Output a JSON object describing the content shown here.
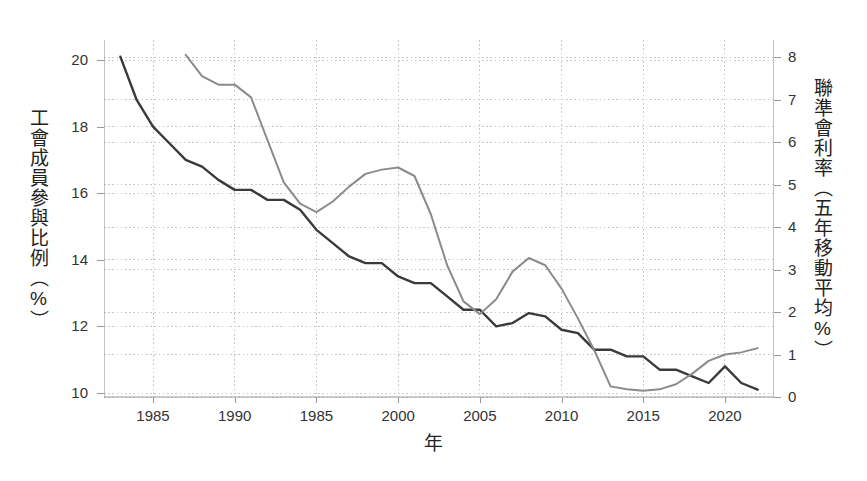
{
  "axes": {
    "left": {
      "title": "工會成員參與比例（%）",
      "ticks": [
        "10",
        "12",
        "14",
        "16",
        "18",
        "20"
      ],
      "min": 10,
      "max": 20
    },
    "right": {
      "title": "聯準會利率（五年移動平均%）",
      "ticks": [
        "0",
        "1",
        "2",
        "3",
        "4",
        "5",
        "6",
        "7",
        "8"
      ],
      "min": 0,
      "max": 8
    },
    "x": {
      "title": "年",
      "ticks": [
        "1985",
        "1990",
        "1985",
        "2000",
        "2005",
        "2010",
        "2015",
        "2020"
      ],
      "tick_values": [
        1985,
        1990,
        1995,
        2000,
        2005,
        2010,
        2015,
        2020
      ],
      "min": 1982,
      "max": 2023
    }
  },
  "colors": {
    "union_line": "#3a3a3a",
    "fed_line": "#8b8b8b",
    "grid": "#c8c8c8",
    "axis": "#9a9a9a",
    "background": "#ffffff"
  },
  "chart_data": {
    "type": "line",
    "title": "",
    "xlabel": "年",
    "ylabel": "工會成員參與比例（%）",
    "ylabel_right": "聯準會利率（五年移動平均%）",
    "xlim": [
      1982,
      2023
    ],
    "ylim": [
      10,
      20
    ],
    "ylim_right": [
      0,
      8
    ],
    "grid": true,
    "legend": "none",
    "series": [
      {
        "name": "工會成員參與比例（%）",
        "axis": "left",
        "color": "#3a3a3a",
        "x": [
          1983,
          1984,
          1985,
          1986,
          1987,
          1988,
          1989,
          1990,
          1991,
          1992,
          1993,
          1994,
          1995,
          1996,
          1997,
          1998,
          1999,
          2000,
          2001,
          2002,
          2003,
          2004,
          2005,
          2006,
          2007,
          2008,
          2009,
          2010,
          2011,
          2012,
          2013,
          2014,
          2015,
          2016,
          2017,
          2018,
          2019,
          2020,
          2021,
          2022
        ],
        "values": [
          20.1,
          18.8,
          18.0,
          17.5,
          17.0,
          16.8,
          16.4,
          16.1,
          16.1,
          15.8,
          15.8,
          15.5,
          14.9,
          14.5,
          14.1,
          13.9,
          13.9,
          13.5,
          13.3,
          13.3,
          12.9,
          12.5,
          12.5,
          12.0,
          12.1,
          12.4,
          12.3,
          11.9,
          11.8,
          11.3,
          11.3,
          11.1,
          11.1,
          10.7,
          10.7,
          10.5,
          10.3,
          10.8,
          10.3,
          10.1
        ]
      },
      {
        "name": "聯準會利率（五年移動平均%）",
        "axis": "right",
        "color": "#8b8b8b",
        "x": [
          1987,
          1988,
          1989,
          1990,
          1991,
          1992,
          1993,
          1994,
          1995,
          1996,
          1997,
          1998,
          1999,
          2000,
          2001,
          2002,
          2003,
          2004,
          2005,
          2006,
          2007,
          2008,
          2009,
          2010,
          2011,
          2012,
          2013,
          2014,
          2015,
          2016,
          2017,
          2018,
          2019,
          2020,
          2021,
          2022
        ],
        "values": [
          8.05,
          7.55,
          7.35,
          7.35,
          7.05,
          6.05,
          5.05,
          4.55,
          4.35,
          4.6,
          4.95,
          5.25,
          5.35,
          5.4,
          5.2,
          4.3,
          3.1,
          2.25,
          1.95,
          2.3,
          2.95,
          3.27,
          3.1,
          2.55,
          1.85,
          1.1,
          0.25,
          0.18,
          0.15,
          0.18,
          0.3,
          0.55,
          0.85,
          1.0,
          1.05,
          1.15
        ]
      }
    ]
  }
}
